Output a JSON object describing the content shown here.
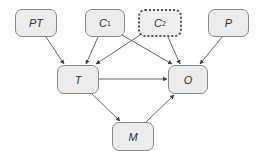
{
  "diagram": {
    "nodes": [
      {
        "id": "PT",
        "label": "PT",
        "sub": "",
        "x": 15,
        "y": 9,
        "w": 42,
        "h": 28,
        "style": "solid"
      },
      {
        "id": "C1",
        "label": "C",
        "sub": "1",
        "x": 85,
        "y": 9,
        "w": 40,
        "h": 28,
        "style": "solid"
      },
      {
        "id": "C2",
        "label": "C",
        "sub": "2",
        "x": 138,
        "y": 9,
        "w": 44,
        "h": 28,
        "style": "dotted"
      },
      {
        "id": "P",
        "label": "P",
        "sub": "",
        "x": 208,
        "y": 9,
        "w": 41,
        "h": 28,
        "style": "solid"
      },
      {
        "id": "T",
        "label": "T",
        "sub": "",
        "x": 57,
        "y": 65,
        "w": 42,
        "h": 29,
        "style": "solid"
      },
      {
        "id": "O",
        "label": "O",
        "sub": "",
        "x": 168,
        "y": 65,
        "w": 40,
        "h": 29,
        "style": "solid"
      },
      {
        "id": "M",
        "label": "M",
        "sub": "",
        "x": 112,
        "y": 122,
        "w": 42,
        "h": 29,
        "style": "solid"
      }
    ],
    "edges": [
      {
        "from": "PT",
        "to": "T",
        "x1": 46,
        "y1": 37,
        "x2": 64,
        "y2": 64
      },
      {
        "from": "C1",
        "to": "T",
        "x1": 98,
        "y1": 37,
        "x2": 86,
        "y2": 64
      },
      {
        "from": "C2",
        "to": "T",
        "x1": 140,
        "y1": 35,
        "x2": 96,
        "y2": 64
      },
      {
        "from": "C1",
        "to": "O",
        "x1": 122,
        "y1": 35,
        "x2": 172,
        "y2": 64
      },
      {
        "from": "C2",
        "to": "O",
        "x1": 168,
        "y1": 37,
        "x2": 180,
        "y2": 64
      },
      {
        "from": "P",
        "to": "O",
        "x1": 222,
        "y1": 37,
        "x2": 200,
        "y2": 64
      },
      {
        "from": "T",
        "to": "O",
        "x1": 99,
        "y1": 79,
        "x2": 167,
        "y2": 79
      },
      {
        "from": "T",
        "to": "M",
        "x1": 92,
        "y1": 94,
        "x2": 120,
        "y2": 121
      },
      {
        "from": "M",
        "to": "O",
        "x1": 146,
        "y1": 122,
        "x2": 174,
        "y2": 95
      }
    ],
    "colors": {
      "edge": "#555555",
      "node_fill": "#ececec",
      "node_border": "#8a8a8a"
    }
  }
}
